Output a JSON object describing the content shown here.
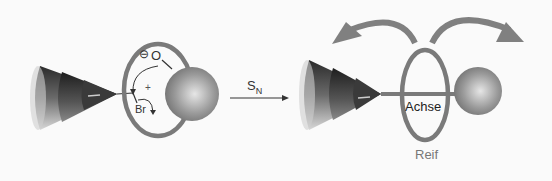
{
  "diagram": {
    "left_panel": {
      "labels": {
        "charge_minus": "⊖",
        "oxygen": "O",
        "plus": "+",
        "bromine": "Br"
      }
    },
    "reaction_arrow": {
      "label_main": "S",
      "label_sub": "N"
    },
    "right_panel": {
      "labels": {
        "axle": "Achse",
        "ring": "Reif"
      }
    },
    "colors": {
      "ring": "#7a7a7a",
      "sphere": "#8c8c8c",
      "rotation_arrows": "#808080",
      "text": "#333333",
      "ring_label": "#777777"
    }
  }
}
